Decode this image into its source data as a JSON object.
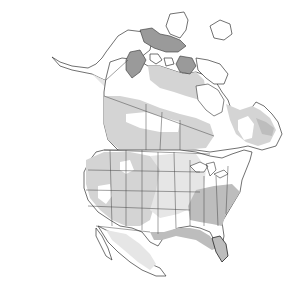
{
  "map": {
    "type": "range-map",
    "region": "North America",
    "colors": {
      "background": "#ffffff",
      "absent": "#ffffff",
      "range_light": "#d4d4d4",
      "range_lighter": "#e6e6e6",
      "range_mid": "#bdbdbd",
      "range_dark": "#9a9a9a",
      "outline": "#333333"
    },
    "legend": []
  }
}
